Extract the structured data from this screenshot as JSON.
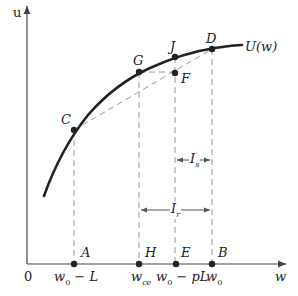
{
  "diagram": {
    "type": "utility-function-insurance",
    "curve_label": "U(w)",
    "axes": {
      "y_label": "u",
      "x_label": "w",
      "origin_label": "0"
    },
    "points": [
      {
        "id": "C",
        "label": "C"
      },
      {
        "id": "G",
        "label": "G"
      },
      {
        "id": "J",
        "label": "J"
      },
      {
        "id": "D",
        "label": "D"
      },
      {
        "id": "F",
        "label": "F"
      },
      {
        "id": "A",
        "label": "A"
      },
      {
        "id": "H",
        "label": "H"
      },
      {
        "id": "E",
        "label": "E"
      },
      {
        "id": "B",
        "label": "B"
      }
    ],
    "x_ticks": [
      "w₀ − L",
      "w_ce",
      "w₀ − pL",
      "w₀"
    ],
    "x_tick_parts": {
      "a_main": "w",
      "a_sub": "0",
      "a_rest": " − L",
      "h_main": "w",
      "h_sub": "ce",
      "e_main": "w",
      "e_sub": "0",
      "e_rest": " − pL",
      "b_main": "w",
      "b_sub": "0"
    },
    "intervals": [
      {
        "label_main": "I",
        "label_sub": "s",
        "from": "E",
        "to": "B"
      },
      {
        "label_main": "I",
        "label_sub": "r",
        "from": "H",
        "to": "B"
      }
    ],
    "colors": {
      "curve": "#222222",
      "dashed": "#999999",
      "axis": "#444444"
    }
  }
}
